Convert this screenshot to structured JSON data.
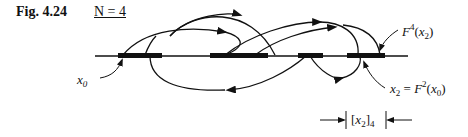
{
  "figure": {
    "label": "Fig. 4.24",
    "parameter": "N = 4"
  },
  "annotations": {
    "x0": "x0",
    "f4": "F4(x2)",
    "x2": "x2 = F2(x0)",
    "interval": "[x2]4"
  }
}
